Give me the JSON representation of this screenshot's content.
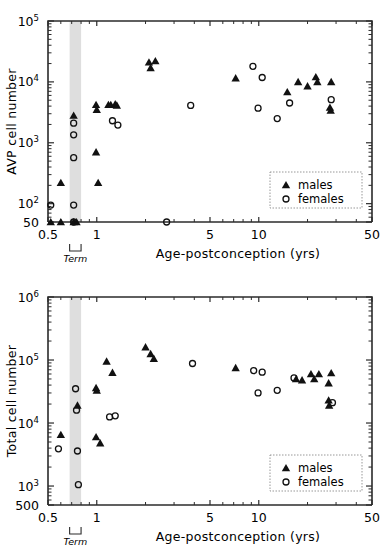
{
  "figure": {
    "panel_count": 2,
    "marker_styles": {
      "males": "filled-triangle",
      "females": "open-circle"
    }
  },
  "legend": {
    "males_label": "males",
    "females_label": "females"
  },
  "axis": {
    "x_title": "Age-postconception  (yrs)",
    "x_ticks": [
      "0.5",
      "1",
      "5",
      "10",
      "50"
    ],
    "term_label": "Term"
  },
  "chart_data": [
    {
      "id": "avp-panel",
      "type": "scatter",
      "title": "",
      "xlabel": "Age-postconception  (yrs)",
      "ylabel": "AVP cell number",
      "xscale": "log",
      "yscale": "log",
      "xlim": [
        0.5,
        50
      ],
      "ylim": [
        50,
        100000
      ],
      "xtick_values": [
        0.5,
        1,
        5,
        10,
        50
      ],
      "xtick_labels": [
        "0.5",
        "1",
        "5",
        "10",
        "50"
      ],
      "ytick_values": [
        50,
        100,
        1000,
        10000,
        100000
      ],
      "ytick_labels": [
        "50",
        "10^2",
        "10^3",
        "10^4",
        "10^5"
      ],
      "grid": false,
      "legend_position": "lower-right",
      "annotations": [
        {
          "name": "term-band",
          "type": "vspan",
          "x_start": 0.68,
          "x_end": 0.8
        },
        {
          "name": "term-bracket",
          "type": "bracket",
          "x_start": 0.68,
          "x_end": 0.8,
          "label": "Term"
        }
      ],
      "series": [
        {
          "name": "males",
          "marker": "filled-triangle",
          "color": "#111111",
          "points": [
            [
              0.52,
              50
            ],
            [
              0.6,
              50
            ],
            [
              0.72,
              50
            ],
            [
              0.75,
              50
            ],
            [
              0.6,
              220
            ],
            [
              0.72,
              2800
            ],
            [
              0.99,
              700
            ],
            [
              1.02,
              220
            ],
            [
              0.99,
              4200
            ],
            [
              1.0,
              3500
            ],
            [
              1.18,
              4200
            ],
            [
              1.22,
              4200
            ],
            [
              1.3,
              4300
            ],
            [
              1.33,
              4100
            ],
            [
              2.1,
              21000
            ],
            [
              2.15,
              17000
            ],
            [
              2.3,
              22000
            ],
            [
              7.2,
              11500
            ],
            [
              15.0,
              6800
            ],
            [
              17.5,
              10000
            ],
            [
              20.0,
              8500
            ],
            [
              22.5,
              12000
            ],
            [
              23.0,
              10000
            ],
            [
              28.0,
              10000
            ],
            [
              27.5,
              3800
            ],
            [
              27.8,
              3400
            ]
          ]
        },
        {
          "name": "females",
          "marker": "open-circle",
          "color": "#111111",
          "points": [
            [
              0.52,
              95
            ],
            [
              0.72,
              95
            ],
            [
              0.72,
              50
            ],
            [
              0.72,
              2100
            ],
            [
              0.72,
              1350
            ],
            [
              0.72,
              570
            ],
            [
              1.25,
              2300
            ],
            [
              1.35,
              1950
            ],
            [
              2.7,
              50
            ],
            [
              3.8,
              4100
            ],
            [
              9.2,
              18000
            ],
            [
              10.5,
              11800
            ],
            [
              9.9,
              3700
            ],
            [
              13.0,
              2500
            ],
            [
              15.5,
              4500
            ],
            [
              28.0,
              5100
            ]
          ]
        }
      ]
    },
    {
      "id": "total-panel",
      "type": "scatter",
      "title": "",
      "xlabel": "Age-postconception  (yrs)",
      "ylabel": "Total cell number",
      "xscale": "log",
      "yscale": "log",
      "xlim": [
        0.5,
        50
      ],
      "ylim": [
        500,
        1000000
      ],
      "xtick_values": [
        0.5,
        1,
        5,
        10,
        50
      ],
      "xtick_labels": [
        "0.5",
        "1",
        "5",
        "10",
        "50"
      ],
      "ytick_values": [
        500,
        1000,
        10000,
        100000,
        1000000
      ],
      "ytick_labels": [
        "500",
        "10^3",
        "10^4",
        "10^5",
        "10^6"
      ],
      "grid": false,
      "legend_position": "lower-right",
      "annotations": [
        {
          "name": "term-band",
          "type": "vspan",
          "x_start": 0.68,
          "x_end": 0.8
        },
        {
          "name": "term-bracket",
          "type": "bracket",
          "x_start": 0.68,
          "x_end": 0.8,
          "label": "Term"
        }
      ],
      "series": [
        {
          "name": "males",
          "marker": "filled-triangle",
          "color": "#111111",
          "points": [
            [
              0.6,
              6500
            ],
            [
              0.76,
              19000
            ],
            [
              0.99,
              36000
            ],
            [
              1.0,
              33000
            ],
            [
              0.99,
              6000
            ],
            [
              1.05,
              4800
            ],
            [
              1.15,
              95000
            ],
            [
              1.25,
              63000
            ],
            [
              2.0,
              160000
            ],
            [
              2.15,
              125000
            ],
            [
              2.25,
              105000
            ],
            [
              7.2,
              75000
            ],
            [
              17.0,
              50000
            ],
            [
              18.5,
              48000
            ],
            [
              21.0,
              60000
            ],
            [
              22.0,
              50000
            ],
            [
              23.5,
              60000
            ],
            [
              28.0,
              62000
            ],
            [
              27.0,
              43000
            ],
            [
              27.0,
              23000
            ],
            [
              27.2,
              19000
            ]
          ]
        },
        {
          "name": "females",
          "marker": "open-circle",
          "color": "#111111",
          "points": [
            [
              0.58,
              3900
            ],
            [
              0.74,
              35000
            ],
            [
              0.75,
              16000
            ],
            [
              0.76,
              3600
            ],
            [
              0.77,
              1050
            ],
            [
              1.2,
              12500
            ],
            [
              1.3,
              13000
            ],
            [
              3.9,
              88000
            ],
            [
              9.3,
              68000
            ],
            [
              10.5,
              64000
            ],
            [
              9.9,
              30000
            ],
            [
              13.0,
              33000
            ],
            [
              16.5,
              52000
            ],
            [
              28.5,
              21000
            ]
          ]
        }
      ]
    }
  ]
}
